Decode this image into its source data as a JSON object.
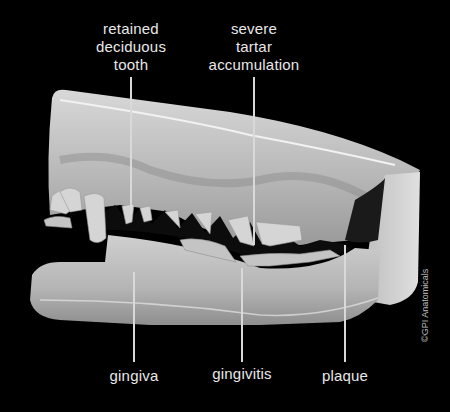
{
  "figure": {
    "background_color": "#000000",
    "label_color": "#e8e8e8"
  },
  "labels": {
    "retained_deciduous_tooth": [
      "retained",
      "deciduous",
      "tooth"
    ],
    "severe_tartar_accumulation": [
      "severe",
      "tartar",
      "accumulation"
    ],
    "gingiva": "gingiva",
    "gingivitis": "gingivitis",
    "plaque": "plaque"
  },
  "copyright": "©GPI Anatomicals"
}
